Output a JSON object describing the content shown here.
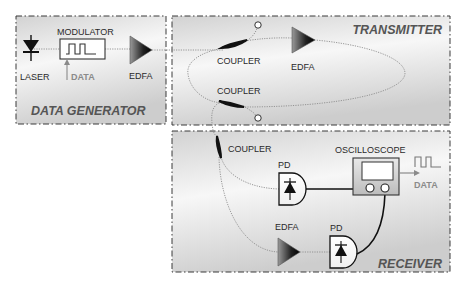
{
  "diagram": {
    "type": "optical fiber loop setup",
    "panels": {
      "data_generator": {
        "title": "DATA GENERATOR"
      },
      "transmitter": {
        "title": "TRANSMITTER"
      },
      "receiver": {
        "title": "RECEIVER"
      }
    },
    "data_generator": {
      "laser_label": "LASER",
      "modulator_label": "MODULATOR",
      "data_input_label": "DATA",
      "edfa_label": "EDFA"
    },
    "transmitter": {
      "coupler_top_label": "COUPLER",
      "coupler_bottom_label": "COUPLER",
      "edfa_label": "EDFA"
    },
    "receiver": {
      "coupler_label": "COUPLER",
      "pd_top_label": "PD",
      "pd_bottom_label": "PD",
      "edfa_label": "EDFA",
      "oscilloscope_label": "OSCILLOSCOPE",
      "data_output_label": "DATA"
    },
    "colors": {
      "panel_fill_light": "#f4f4f4",
      "panel_fill_dark": "#cfcfcf",
      "fiber": "#8c8c8c",
      "wire": "#111111",
      "data_grey": "#8a8a8a"
    }
  }
}
